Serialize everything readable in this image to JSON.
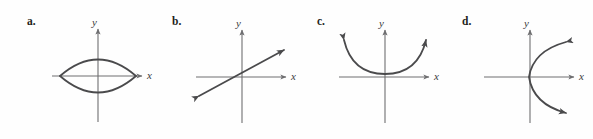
{
  "figure": {
    "background_color": "#fefefe",
    "axis_color": "#6e6e70",
    "curve_color": "#4a4a4c",
    "label_color": "#231f20",
    "axis_label_color": "#3a3a3c"
  },
  "panels": [
    {
      "label": "a.",
      "label_x": 27,
      "label_y": 16,
      "origin_x": 98,
      "origin_y": 76,
      "x_axis": {
        "start": 52,
        "end": 143,
        "label": "x",
        "label_x": 147,
        "label_y": 72
      },
      "y_axis": {
        "start": 122,
        "end": 28,
        "label": "y",
        "label_x": 92,
        "label_y": 17
      },
      "curve": {
        "type": "lens",
        "description": "two arcs forming a lens / vesica shape crossing the x-axis",
        "left_x": 60,
        "right_x": 136,
        "top_y": 52,
        "bottom_y": 100,
        "arrowheads": 0
      }
    },
    {
      "label": "b.",
      "label_x": 172,
      "label_y": 16,
      "origin_x": 242,
      "origin_y": 77,
      "x_axis": {
        "start": 196,
        "end": 287,
        "label": "x",
        "label_x": 291,
        "label_y": 73
      },
      "y_axis": {
        "start": 123,
        "end": 29,
        "label": "y",
        "label_x": 236,
        "label_y": 18
      },
      "curve": {
        "type": "line",
        "description": "straight line with arrowheads on both ends, positive slope",
        "x1": 198,
        "y1": 96,
        "x2": 288,
        "y2": 48,
        "arrowheads": 2
      }
    },
    {
      "label": "c.",
      "label_x": 317,
      "label_y": 16,
      "origin_x": 385,
      "origin_y": 77,
      "x_axis": {
        "start": 339,
        "end": 430,
        "label": "x",
        "label_x": 434,
        "label_y": 73
      },
      "y_axis": {
        "start": 123,
        "end": 29,
        "label": "y",
        "label_x": 379,
        "label_y": 18
      },
      "curve": {
        "type": "parabola-up",
        "description": "upward-opening parabola, vertex at origin, arrowheads on both ends",
        "vertex_x": 385,
        "vertex_y": 74,
        "left_end_x": 340,
        "left_end_y": 35,
        "right_end_x": 430,
        "right_end_y": 35,
        "arrowheads": 2
      }
    },
    {
      "label": "d.",
      "label_x": 462,
      "label_y": 16,
      "origin_x": 530,
      "origin_y": 77,
      "x_axis": {
        "start": 484,
        "end": 575,
        "label": "x",
        "label_x": 579,
        "label_y": 73
      },
      "y_axis": {
        "start": 123,
        "end": 29,
        "label": "y",
        "label_x": 524,
        "label_y": 18
      },
      "curve": {
        "type": "parabola-right",
        "description": "rightward-opening parabola, vertex at origin, arrowheads on both ends",
        "vertex_x": 528,
        "vertex_y": 77,
        "top_end_x": 573,
        "top_end_y": 38,
        "bottom_end_x": 573,
        "bottom_end_y": 118,
        "arrowheads": 2
      }
    }
  ]
}
